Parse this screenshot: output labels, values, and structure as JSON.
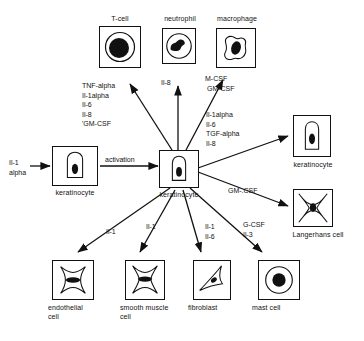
{
  "diagram": {
    "stroke_color": "#111111",
    "background": "#ffffff",
    "cells": [
      {
        "id": "t-cell",
        "label": "T-cell",
        "shape": "round-cell-large-nucleus"
      },
      {
        "id": "neutrophil",
        "label": "neutrophil",
        "shape": "round-cell-lobed-nucleus"
      },
      {
        "id": "macrophage",
        "label": "macrophage",
        "shape": "amoeboid-cell"
      },
      {
        "id": "keratinocyte-left",
        "label": "keratinocyte",
        "shape": "columnar-keratinocyte"
      },
      {
        "id": "keratinocyte-center",
        "label": "keratinocyte",
        "shape": "columnar-keratinocyte"
      },
      {
        "id": "keratinocyte-right",
        "label": "keratinocyte",
        "shape": "columnar-keratinocyte"
      },
      {
        "id": "langerhans-cell",
        "label": "Langerhans cell",
        "shape": "dendritic-star-cell"
      },
      {
        "id": "endothelial-cell",
        "label": "endothelial\ncell",
        "shape": "stellate-flat-cell"
      },
      {
        "id": "smooth-muscle-cell",
        "label": "smooth muscle\ncell",
        "shape": "stellate-flat-cell"
      },
      {
        "id": "fibroblast",
        "label": "fibroblast",
        "shape": "spindle-triangular-cell"
      },
      {
        "id": "mast-cell",
        "label": "mast cell",
        "shape": "round-cell-central-nucleus"
      }
    ],
    "inputs": [
      {
        "id": "il-1-alpha-input",
        "label": "Il-1\nalpha",
        "target": "keratinocyte-left"
      }
    ],
    "process_labels": [
      {
        "id": "activation",
        "label": "activation"
      }
    ],
    "cytokine_groups": [
      {
        "id": "t-cell-cytokines",
        "target": "t-cell",
        "items": [
          "TNF-alpha",
          "Il-1alpha",
          "Il-6",
          "Il-8",
          "'GM-CSF"
        ],
        "text": "TNF-alpha\nIl-1alpha\nIl-6\nIl-8\n'GM-CSF"
      },
      {
        "id": "neutrophil-cytokines",
        "target": "neutrophil",
        "items": [
          "Il-8"
        ],
        "text": "Il-8"
      },
      {
        "id": "macrophage-cytokines",
        "target": "macrophage",
        "items": [
          "M-CSF",
          "GM-CSF"
        ],
        "text": "M-CSF\n GM-CSF"
      },
      {
        "id": "keratinocyte-right-cytokines",
        "target": "keratinocyte-right",
        "items": [
          "Il-1alpha",
          "Il-6",
          "TGF-alpha",
          "Il-8"
        ],
        "text": "Il-1alpha\nIl-6\nTGF-alpha\nIl-8"
      },
      {
        "id": "langerhans-cytokines",
        "target": "langerhans-cell",
        "items": [
          "GM-.CSF"
        ],
        "text": "GM-.CSF"
      },
      {
        "id": "endothelial-cytokines",
        "target": "endothelial-cell",
        "items": [
          "Il-1"
        ],
        "text": "Il-1"
      },
      {
        "id": "smooth-muscle-cytokines",
        "target": "smooth-muscle-cell",
        "items": [
          "Il-1"
        ],
        "text": "Il-1"
      },
      {
        "id": "fibroblast-cytokines",
        "target": "fibroblast",
        "items": [
          "Il-1",
          "Il-6"
        ],
        "text": "Il-1\nIl-6"
      },
      {
        "id": "mast-cell-cytokines",
        "target": "mast-cell",
        "items": [
          "G-CSF",
          "Il-3"
        ],
        "text": "G-CSF\nIl-3"
      }
    ]
  }
}
